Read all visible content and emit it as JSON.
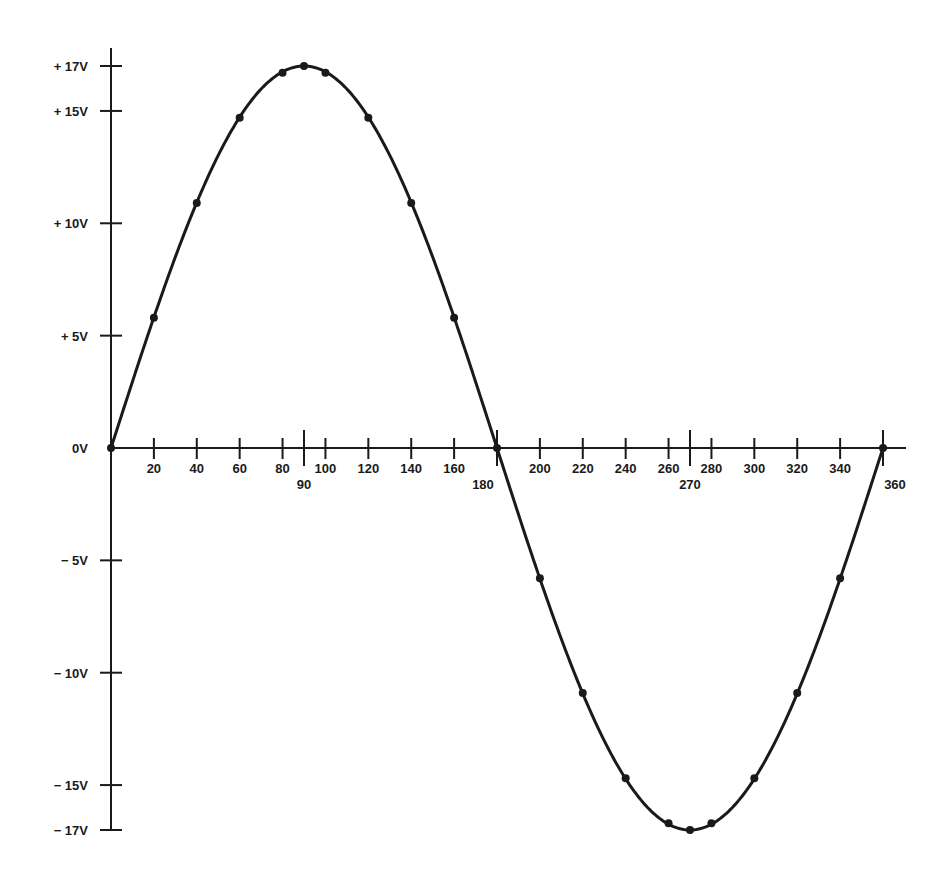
{
  "chart_data": {
    "type": "line",
    "title": "",
    "xlabel": "",
    "ylabel": "",
    "xlim": [
      0,
      360
    ],
    "ylim": [
      -17,
      17
    ],
    "grid": false,
    "legend": null,
    "x_ticks": [
      20,
      40,
      60,
      80,
      90,
      100,
      120,
      140,
      160,
      180,
      200,
      220,
      240,
      260,
      270,
      280,
      300,
      320,
      340,
      360
    ],
    "x_tick_labels": [
      "20",
      "40",
      "60",
      "80",
      "90",
      "100",
      "120",
      "140",
      "160",
      "180",
      "200",
      "220",
      "240",
      "260",
      "270",
      "280",
      "300",
      "320",
      "340",
      "360"
    ],
    "y_ticks": [
      17,
      15,
      10,
      5,
      0,
      -5,
      -10,
      -15,
      -17
    ],
    "y_tick_labels": [
      "+17V",
      "+15V",
      "+10V",
      "+5V",
      "0V",
      "-5V",
      "-10V",
      "-15V",
      "-17V"
    ],
    "series": [
      {
        "name": "sine wave (17V peak)",
        "x": [
          0,
          20,
          40,
          60,
          80,
          90,
          100,
          120,
          140,
          160,
          180,
          200,
          220,
          240,
          260,
          270,
          280,
          300,
          320,
          340,
          360
        ],
        "values": [
          0,
          5.8,
          10.9,
          14.7,
          16.7,
          17,
          16.7,
          14.7,
          10.9,
          5.8,
          0,
          -5.8,
          -10.9,
          -14.7,
          -16.7,
          -17,
          -16.7,
          -14.7,
          -10.9,
          -5.8,
          0
        ]
      }
    ]
  },
  "colors": {
    "line": "#1a1a1a",
    "axis": "#1a1a1a",
    "background": "#ffffff"
  }
}
